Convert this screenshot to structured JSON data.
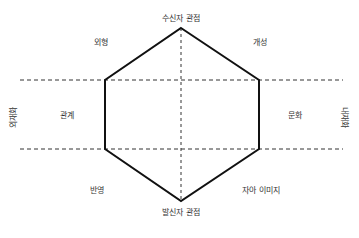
{
  "diagram": {
    "type": "identity-prism",
    "labels": {
      "top": "수신자 관점",
      "bottom": "발신자 관점",
      "upper_left": "외형",
      "upper_right": "개성",
      "middle_left": "관계",
      "middle_right": "문화",
      "lower_left": "반영",
      "lower_right": "자아 이미지",
      "side_left": "외재화",
      "side_right": "내재화"
    },
    "colors": {
      "outline": "#111111",
      "dashed": "#333333",
      "text": "#333333"
    }
  }
}
